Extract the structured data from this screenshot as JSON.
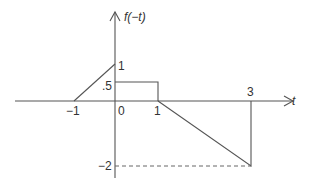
{
  "diagram": {
    "y_axis_label": "f(−t)",
    "x_axis_label": "t",
    "x_ticks": [
      {
        "label": "−1",
        "value": -1
      },
      {
        "label": "0",
        "value": 0
      },
      {
        "label": "1",
        "value": 1
      },
      {
        "label": "3",
        "value": 3
      }
    ],
    "y_ticks": [
      {
        "label": "1",
        "value": 1
      },
      {
        "label": ".5",
        "value": 0.5
      },
      {
        "label": "−2",
        "value": -2
      }
    ],
    "segments": [
      {
        "type": "ramp",
        "from": [
          -1,
          0
        ],
        "to": [
          0,
          1
        ]
      },
      {
        "type": "pulse",
        "from": [
          0,
          0.5
        ],
        "to": [
          1,
          0.5
        ]
      },
      {
        "type": "ramp",
        "from": [
          1,
          0
        ],
        "to": [
          3,
          -2
        ]
      },
      {
        "type": "vertical-return",
        "from": [
          3,
          -2
        ],
        "to": [
          3,
          0
        ]
      }
    ],
    "guide_lines": [
      {
        "style": "dashed",
        "from": [
          0,
          -2
        ],
        "to": [
          3,
          -2
        ]
      }
    ],
    "colors": {
      "line": "#555555",
      "text": "#333333",
      "background": "#ffffff"
    }
  }
}
